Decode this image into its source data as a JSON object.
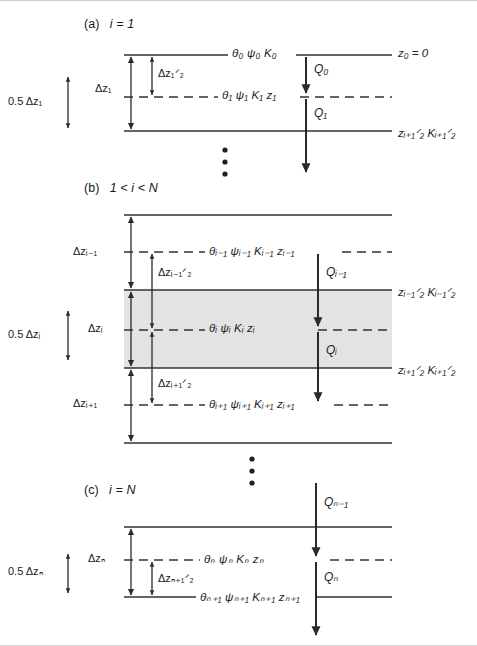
{
  "figure": {
    "type": "schematic-diagram",
    "panels": [
      {
        "id": "a",
        "heading_prefix": "(a)",
        "heading": "i = 1",
        "layers": [
          {
            "kind": "solid-boundary",
            "labels_center": "θ₀  ψ₀  K₀",
            "label_right": "z₀ = 0"
          },
          {
            "kind": "dashed-node",
            "labels_center": "θ₁  ψ₁  K₁  z₁",
            "label_right": ""
          },
          {
            "kind": "solid-boundary",
            "labels_center": "",
            "label_right": "zᵢ₊₁ᐟ₂  Kᵢ₊₁ᐟ₂"
          }
        ],
        "thickness_labels": {
          "half_upper": "Δz₁ᐟ₂",
          "full": "Δz₁",
          "half_outer": "0.5 Δz₁"
        },
        "fluxes": [
          {
            "name": "Q₀",
            "from": "surface",
            "to": "node-1"
          },
          {
            "name": "Q₁",
            "from": "node-1",
            "to": "below"
          }
        ]
      },
      {
        "id": "b",
        "heading_prefix": "(b)",
        "heading": "1 < i < N",
        "layers": [
          {
            "kind": "solid-boundary",
            "labels_center": "",
            "label_right": ""
          },
          {
            "kind": "dashed-node",
            "labels_center": "θᵢ₋₁ ψᵢ₋₁ Kᵢ₋₁ zᵢ₋₁",
            "label_right": ""
          },
          {
            "kind": "solid-boundary",
            "labels_center": "",
            "label_right": "zᵢ₋₁ᐟ₂  Kᵢ₋₁ᐟ₂"
          },
          {
            "kind": "dashed-node",
            "labels_center": "θᵢ  ψᵢ  Kᵢ  zᵢ",
            "label_right": ""
          },
          {
            "kind": "solid-boundary",
            "labels_center": "",
            "label_right": "zᵢ₊₁ᐟ₂  Kᵢ₊₁ᐟ₂"
          },
          {
            "kind": "dashed-node",
            "labels_center": "θᵢ₊₁ ψᵢ₊₁ Kᵢ₊₁ zᵢ₊₁",
            "label_right": ""
          },
          {
            "kind": "solid-boundary",
            "labels_center": "",
            "label_right": ""
          }
        ],
        "thickness_labels": {
          "dz_prev": "Δzᵢ₋₁",
          "dz_half_upper": "Δzᵢ₋₁ᐟ₂",
          "dz_cur": "Δzᵢ",
          "dz_half_lower": "Δzᵢ₊₁ᐟ₂",
          "dz_next": "Δzᵢ₊₁",
          "half_outer": "0.5 Δzᵢ"
        },
        "fluxes": [
          {
            "name": "Qᵢ₋₁",
            "from": "node-i-1",
            "to": "node-i"
          },
          {
            "name": "Qᵢ",
            "from": "node-i",
            "to": "node-i+1"
          }
        ],
        "highlight": {
          "shaded": true,
          "color": "#e3e3e3",
          "spans": "control volume between z_i-1/2 and z_i+1/2"
        }
      },
      {
        "id": "c",
        "heading_prefix": "(c)",
        "heading": "i = N",
        "layers": [
          {
            "kind": "solid-boundary",
            "labels_center": "",
            "label_right": ""
          },
          {
            "kind": "dashed-node",
            "labels_center": "θₙ  ψₙ  Kₙ  zₙ",
            "label_right": ""
          },
          {
            "kind": "solid-boundary",
            "labels_center": "θₙ₊₁ ψₙ₊₁ Kₙ₊₁ zₙ₊₁",
            "label_right": ""
          }
        ],
        "thickness_labels": {
          "full": "Δzₙ",
          "half_lower": "Δzₙ₊₁ᐟ₂",
          "half_outer": "0.5 Δzₙ"
        },
        "fluxes": [
          {
            "name": "Qₙ₋₁",
            "from": "above",
            "to": "node-N"
          },
          {
            "name": "Qₙ",
            "from": "node-N",
            "to": "bottom"
          }
        ]
      }
    ],
    "ellipsis_markers": [
      {
        "between": "panel-a",
        "and": "panel-b",
        "glyph": "⋮"
      },
      {
        "between": "panel-b",
        "and": "panel-c",
        "glyph": "⋮"
      }
    ],
    "symbols": {
      "theta": "θ — volumetric water content",
      "psi": "ψ — matric potential",
      "K": "K — hydraulic conductivity",
      "z": "z — depth",
      "Q": "Q — water flux",
      "dz": "Δz — layer thickness"
    },
    "colors": {
      "line": "#333333",
      "shade": "#e3e3e3",
      "text": "#1a1a1a",
      "frame": "#cfcfcf"
    }
  }
}
